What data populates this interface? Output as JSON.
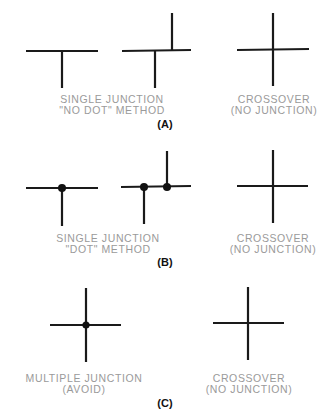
{
  "figure": {
    "panels": [
      {
        "id": "A",
        "tag": "(A)",
        "left_caption": {
          "line1": "SINGLE JUNCTION",
          "line2": "\"NO DOT\" METHOD"
        },
        "right_caption": {
          "line1": "CROSSOVER",
          "line2": "(NO JUNCTION)"
        }
      },
      {
        "id": "B",
        "tag": "(B)",
        "left_caption": {
          "line1": "SINGLE JUNCTION",
          "line2": "\"DOT\" METHOD"
        },
        "right_caption": {
          "line1": "CROSSOVER",
          "line2": "(NO JUNCTION)"
        }
      },
      {
        "id": "C",
        "tag": "(C)",
        "left_caption": {
          "line1": "MULTIPLE JUNCTION",
          "line2": "(AVOID)"
        },
        "right_caption": {
          "line1": "CROSSOVER",
          "line2": "(NO JUNCTION)"
        }
      }
    ],
    "colors": {
      "wire": "#1a1a1a",
      "caption": "#9a9a9a",
      "tag": "#111111"
    }
  }
}
